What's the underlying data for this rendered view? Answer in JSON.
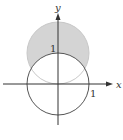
{
  "diagram": {
    "type": "polar-region",
    "axes": {
      "x_label": "x",
      "y_label": "y"
    },
    "tick_labels": {
      "x_tick": "1",
      "y_tick": "1"
    },
    "curves": [
      {
        "name": "circle r=1 centered at origin",
        "center": [
          0,
          0
        ],
        "radius": 1,
        "filled": false
      },
      {
        "name": "circle r=1 centered at (0,1)",
        "center": [
          0,
          1
        ],
        "radius": 1,
        "filled": true
      }
    ],
    "shaded_region": "inside circle centered at (0,1), outside circle centered at origin",
    "colors": {
      "stroke": "#555555",
      "fill": "#d4d4d4",
      "axis": "#333333"
    }
  }
}
